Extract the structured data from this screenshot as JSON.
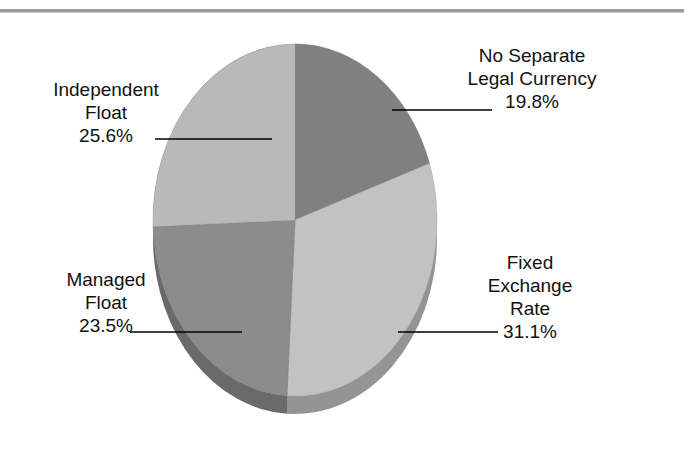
{
  "chart_data": {
    "type": "pie",
    "title": "",
    "subtitle": "",
    "xlabel": "",
    "ylabel": "",
    "legend_position": "none",
    "grid": false,
    "style": "3d-pie",
    "start_angle_deg": 0,
    "direction": "clockwise",
    "categories": [
      "No Separate Legal Currency",
      "Fixed Exchange Rate",
      "Managed Float",
      "Independent Float"
    ],
    "values": [
      19.8,
      31.1,
      23.5,
      25.6
    ],
    "value_unit": "%",
    "slices": [
      {
        "label_line_1": "No Separate",
        "label_line_2": "Legal Currency",
        "name": "No Separate Legal Currency",
        "value": 19.8,
        "value_text": "19.8%",
        "color": "#808080",
        "side_color": "#5e5e5e"
      },
      {
        "label_line_1": "Fixed",
        "label_line_2": "Exchange",
        "label_line_3": "Rate",
        "name": "Fixed Exchange Rate",
        "value": 31.1,
        "value_text": "31.1%",
        "color": "#c2c2c2",
        "side_color": "#949494"
      },
      {
        "label_line_1": "Managed",
        "label_line_2": "Float",
        "name": "Managed Float",
        "value": 23.5,
        "value_text": "23.5%",
        "color": "#8c8c8c",
        "side_color": "#6a6a6a"
      },
      {
        "label_line_1": "Independent",
        "label_line_2": "Float",
        "name": "Independent Float",
        "value": 25.6,
        "value_text": "25.6%",
        "color": "#b9b9b9",
        "side_color": "#8d8d8d"
      }
    ]
  },
  "labels": {
    "no_separate": {
      "line1": "No Separate",
      "line2": "Legal Currency",
      "pct": "19.8%"
    },
    "fixed": {
      "line1": "Fixed",
      "line2": "Exchange",
      "line3": "Rate",
      "pct": "31.1%"
    },
    "managed": {
      "line1": "Managed",
      "line2": "Float",
      "pct": "23.5%"
    },
    "independent": {
      "line1": "Independent",
      "line2": "Float",
      "pct": "25.6%"
    }
  },
  "colors": {
    "rule": "#9a9a9a",
    "leader_line": "#000000",
    "background": "#ffffff",
    "text": "#111111"
  }
}
